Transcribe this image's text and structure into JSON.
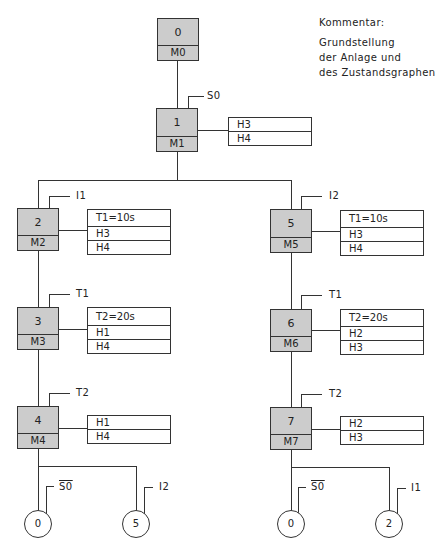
{
  "comment": {
    "title": "Kommentar:",
    "lines": [
      "Grundstellung",
      "der Anlage und",
      "des Zustandsgraphen"
    ]
  },
  "states": [
    {
      "id": "0",
      "memory": "M0"
    },
    {
      "id": "1",
      "memory": "M1",
      "condition": "S0",
      "outputs": [
        "H3",
        "H4"
      ]
    },
    {
      "id": "2",
      "memory": "M2",
      "condition": "I1",
      "outputs": [
        "T1=10s",
        "H3",
        "H4"
      ]
    },
    {
      "id": "3",
      "memory": "M3",
      "condition": "T1",
      "outputs": [
        "T2=20s",
        "H1",
        "H4"
      ]
    },
    {
      "id": "4",
      "memory": "M4",
      "condition": "T2",
      "outputs": [
        "H1",
        "H4"
      ]
    },
    {
      "id": "5",
      "memory": "M5",
      "condition": "I2",
      "outputs": [
        "T1=10s",
        "H3",
        "H4"
      ]
    },
    {
      "id": "6",
      "memory": "M6",
      "condition": "T1",
      "outputs": [
        "T2=20s",
        "H2",
        "H3"
      ]
    },
    {
      "id": "7",
      "memory": "M7",
      "condition": "T2",
      "outputs": [
        "H2",
        "H3"
      ]
    }
  ],
  "jumps": [
    {
      "target": "0",
      "condition": "S0",
      "negated": true
    },
    {
      "target": "5",
      "condition": "I2",
      "negated": false
    },
    {
      "target": "0",
      "condition": "S0",
      "negated": true
    },
    {
      "target": "2",
      "condition": "I1",
      "negated": false
    }
  ]
}
